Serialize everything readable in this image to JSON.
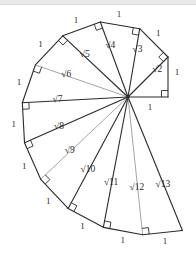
{
  "figure": {
    "name": "Spiral of Theodorus",
    "alt_name": "Square Root Spiral",
    "background_color": "#ffffff",
    "stroke_color": "#2b2b2b",
    "light_stroke_color": "#9a9a9a",
    "label_color": "#2b2b2b",
    "light_label_color": "#8f8f8f",
    "top_band_color": "#e9e9e9"
  },
  "geometry": {
    "center_x": 128,
    "center_y": 97,
    "unit_radius": 40,
    "start_angle_deg": 0,
    "triangle_count": 12
  },
  "chart_data": {
    "type": "diagram",
    "triangles": [
      {
        "index": 1,
        "hypotenuse_label": "√2",
        "leg_label": "1",
        "hyp_value": 1.41421356,
        "prev_hyp_value": 1.0,
        "light": false
      },
      {
        "index": 2,
        "hypotenuse_label": "√3",
        "leg_label": "1",
        "hyp_value": 1.73205081,
        "prev_hyp_value": 1.41421356,
        "light": false
      },
      {
        "index": 3,
        "hypotenuse_label": "√4",
        "leg_label": "1",
        "hyp_value": 2.0,
        "prev_hyp_value": 1.73205081,
        "light": false
      },
      {
        "index": 4,
        "hypotenuse_label": "√5",
        "leg_label": "1",
        "hyp_value": 2.23606798,
        "prev_hyp_value": 2.0,
        "light": false
      },
      {
        "index": 5,
        "hypotenuse_label": "√6",
        "leg_label": "1",
        "hyp_value": 2.44948975,
        "prev_hyp_value": 2.23606798,
        "light": true
      },
      {
        "index": 6,
        "hypotenuse_label": "√7",
        "leg_label": "1",
        "hyp_value": 2.64575131,
        "prev_hyp_value": 2.44948975,
        "light": false
      },
      {
        "index": 7,
        "hypotenuse_label": "√8",
        "leg_label": "1",
        "hyp_value": 2.82842712,
        "prev_hyp_value": 2.64575131,
        "light": false
      },
      {
        "index": 8,
        "hypotenuse_label": "√9",
        "leg_label": "1",
        "hyp_value": 3.0,
        "prev_hyp_value": 2.82842712,
        "light": true
      },
      {
        "index": 9,
        "hypotenuse_label": "√10",
        "leg_label": "1",
        "hyp_value": 3.16227766,
        "prev_hyp_value": 3.0,
        "light": false
      },
      {
        "index": 10,
        "hypotenuse_label": "√11",
        "leg_label": "1",
        "hyp_value": 3.31662479,
        "prev_hyp_value": 3.16227766,
        "light": false
      },
      {
        "index": 11,
        "hypotenuse_label": "√12",
        "leg_label": "1",
        "hyp_value": 3.46410162,
        "prev_hyp_value": 3.31662479,
        "light": true
      },
      {
        "index": 12,
        "hypotenuse_label": "√13",
        "leg_label": "1",
        "hyp_value": 3.60555128,
        "prev_hyp_value": 3.46410162,
        "light": false
      }
    ],
    "base_leg": {
      "label": "1",
      "value": 1.0,
      "note": "initial unit leg from center to first vertex"
    },
    "hypotenuse_labels": [
      "√2",
      "√3",
      "√4",
      "√5",
      "√6",
      "√7",
      "√8",
      "√9",
      "√10",
      "√11",
      "√12",
      "√13"
    ],
    "unit_leg_labels": [
      "1",
      "1",
      "1",
      "1",
      "1",
      "1",
      "1",
      "1",
      "1",
      "1",
      "1",
      "1",
      "1"
    ],
    "right_angle_marks": 13,
    "xlabel": "",
    "ylabel": "",
    "grid": false,
    "legend": "none"
  }
}
